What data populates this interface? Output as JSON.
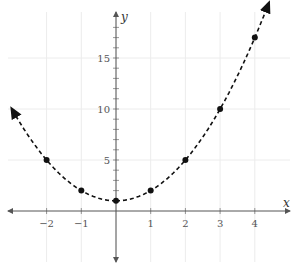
{
  "chart_data": {
    "type": "line",
    "title": "",
    "xlabel": "x",
    "ylabel": "y",
    "function": "y = x^2 + 1",
    "line_style": "dashed",
    "arrows_at_ends": true,
    "grid": true,
    "xlim": [
      -3.1,
      4.9
    ],
    "ylim": [
      -5,
      19.5
    ],
    "x_ticks": [
      -2,
      -1,
      1,
      2,
      3,
      4
    ],
    "x_tick_labels": [
      "−2",
      "−1",
      "1",
      "2",
      "3",
      "4"
    ],
    "y_ticks": [
      5,
      10,
      15
    ],
    "y_tick_labels": [
      "5",
      "10",
      "15"
    ],
    "points": [
      {
        "x": -2,
        "y": 5
      },
      {
        "x": -1,
        "y": 2
      },
      {
        "x": 0,
        "y": 1
      },
      {
        "x": 1,
        "y": 2
      },
      {
        "x": 2,
        "y": 5
      },
      {
        "x": 3,
        "y": 10
      },
      {
        "x": 4,
        "y": 17
      }
    ],
    "x": [
      -2,
      -1,
      0,
      1,
      2,
      3,
      4
    ],
    "series": [
      {
        "name": "y = x² + 1",
        "values": [
          5,
          2,
          1,
          2,
          5,
          10,
          17
        ]
      }
    ],
    "curve_domain": [
      -3.0,
      4.4
    ]
  },
  "colors": {
    "curve": "#111111",
    "point": "#111111",
    "axis": "#555555",
    "grid": "#ececec"
  }
}
